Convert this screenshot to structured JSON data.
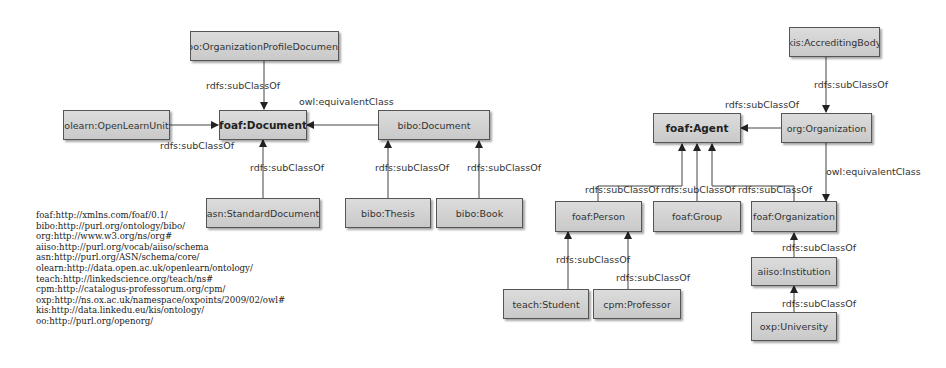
{
  "left_diagram": {
    "nodes": {
      "oo_org_profile_doc": "oo:OrganizationProfileDocument",
      "olearn_unit": "olearn:OpenLearnUnit",
      "foaf_document": "foaf:Document",
      "bibo_document": "bibo:Document",
      "asn_standard_doc": "asn:StandardDocument",
      "bibo_thesis": "bibo:Thesis",
      "bibo_book": "bibo:Book"
    },
    "edges": {
      "oo_to_foaf": "rdfs:subClassOf",
      "bibo_to_foaf": "owl:equivalentClass",
      "olearn_to_foaf": "rdfs:subClassOf",
      "asn_to_foaf": "rdfs:subClassOf",
      "thesis_to_bibo": "rdfs:subClassOf",
      "book_to_bibo": "rdfs:subClassOf"
    }
  },
  "right_diagram": {
    "nodes": {
      "kis_accrediting_body": "kis:AccreditingBody",
      "foaf_agent": "foaf:Agent",
      "org_organization": "org:Organization",
      "foaf_person": "foaf:Person",
      "foaf_group": "foaf:Group",
      "foaf_organization": "foaf:Organization",
      "aiiso_institution": "aiiso:Institution",
      "oxp_university": "oxp:University",
      "teach_student": "teach:Student",
      "cpm_professor": "cpm:Professor"
    },
    "edges": {
      "kis_to_org": "rdfs:subClassOf",
      "org_to_agent": "rdfs:subClassOf",
      "org_to_foaforg": "owl:equivalentClass",
      "person_to_agent": "rdfs:subClassOf",
      "group_to_agent": "rdfs:subClassOf",
      "foaforg_to_agent": "rdfs:subClassOf",
      "institution_to_foaforg": "rdfs:subClassOf",
      "university_to_institution": "rdfs:subClassOf",
      "student_to_person": "rdfs:subClassOf",
      "professor_to_person": "rdfs:subClassOf"
    }
  },
  "namespaces": [
    "foaf:http://xmlns.com/foaf/0.1/",
    "bibo:http://purl.org/ontology/bibo/",
    "org:http://www.w3.org/ns/org#",
    "aiiso:http://purl.org/vocab/aiiso/schema",
    "asn:http://purl.org/ASN/schema/core/",
    "olearn:http://data.open.ac.uk/openlearn/ontology/",
    "teach:http://linkedscience.org/teach/ns#",
    "cpm:http://catalogus-professorum.org/cpm/",
    "oxp:http://ns.ox.ac.uk/namespace/oxpoints/2009/02/owl#",
    "kis:http://data.linkedu.eu/kis/ontology/",
    "oo:http://purl.org/openorg/"
  ]
}
